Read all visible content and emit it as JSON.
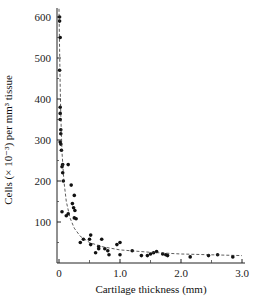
{
  "chart_data": {
    "type": "scatter",
    "title": "",
    "xlabel": "Cartilage thickness (mm)",
    "ylabel": "Cells (× 10⁻³) per mm³ tissue",
    "xlim": [
      0,
      3.0
    ],
    "ylim": [
      0,
      620
    ],
    "x_ticks": [
      {
        "value": 0,
        "label": "0"
      },
      {
        "value": 1.0,
        "label": "1.0"
      },
      {
        "value": 2.0,
        "label": "2.0"
      },
      {
        "value": 3.0,
        "label": "3.0"
      }
    ],
    "y_ticks": [
      {
        "value": 100,
        "label": "100"
      },
      {
        "value": 200,
        "label": "200"
      },
      {
        "value": 300,
        "label": "300"
      },
      {
        "value": 400,
        "label": "400"
      },
      {
        "value": 500,
        "label": "500"
      },
      {
        "value": 600,
        "label": "600"
      }
    ],
    "grid": false,
    "legend": null,
    "series": [
      {
        "name": "Measured cell density",
        "style": "points",
        "color": "#111111",
        "points": [
          [
            0.01,
            600
          ],
          [
            0.01,
            590
          ],
          [
            0.02,
            550
          ],
          [
            0.01,
            470
          ],
          [
            0.02,
            380
          ],
          [
            0.02,
            365
          ],
          [
            0.02,
            350
          ],
          [
            0.03,
            325
          ],
          [
            0.03,
            315
          ],
          [
            0.02,
            295
          ],
          [
            0.03,
            290
          ],
          [
            0.04,
            275
          ],
          [
            0.06,
            240
          ],
          [
            0.05,
            235
          ],
          [
            0.06,
            220
          ],
          [
            0.07,
            200
          ],
          [
            0.05,
            125
          ],
          [
            0.12,
            115
          ],
          [
            0.15,
            120
          ],
          [
            0.15,
            240
          ],
          [
            0.2,
            190
          ],
          [
            0.25,
            165
          ],
          [
            0.22,
            145
          ],
          [
            0.24,
            135
          ],
          [
            0.26,
            128
          ],
          [
            0.25,
            110
          ],
          [
            0.28,
            108
          ],
          [
            0.35,
            50
          ],
          [
            0.4,
            58
          ],
          [
            0.52,
            68
          ],
          [
            0.5,
            58
          ],
          [
            0.52,
            45
          ],
          [
            0.6,
            25
          ],
          [
            0.65,
            40
          ],
          [
            0.65,
            35
          ],
          [
            0.7,
            58
          ],
          [
            0.75,
            35
          ],
          [
            0.8,
            30
          ],
          [
            0.82,
            20
          ],
          [
            0.95,
            45
          ],
          [
            1.0,
            50
          ],
          [
            1.0,
            20
          ],
          [
            1.2,
            30
          ],
          [
            1.35,
            18
          ],
          [
            1.45,
            18
          ],
          [
            1.5,
            22
          ],
          [
            1.55,
            25
          ],
          [
            1.6,
            28
          ],
          [
            1.7,
            22
          ],
          [
            1.75,
            20
          ],
          [
            1.78,
            18
          ],
          [
            2.15,
            15
          ],
          [
            2.45,
            18
          ],
          [
            2.6,
            20
          ],
          [
            2.85,
            15
          ]
        ]
      },
      {
        "name": "Fitted curve",
        "style": "dashed",
        "color": "#333333",
        "points": [
          [
            0.0,
            620
          ],
          [
            0.01,
            520
          ],
          [
            0.02,
            430
          ],
          [
            0.03,
            360
          ],
          [
            0.05,
            270
          ],
          [
            0.08,
            200
          ],
          [
            0.12,
            150
          ],
          [
            0.18,
            110
          ],
          [
            0.25,
            85
          ],
          [
            0.35,
            65
          ],
          [
            0.5,
            50
          ],
          [
            0.7,
            40
          ],
          [
            1.0,
            32
          ],
          [
            1.5,
            26
          ],
          [
            2.0,
            22
          ],
          [
            2.5,
            20
          ],
          [
            3.0,
            18
          ]
        ]
      }
    ]
  }
}
